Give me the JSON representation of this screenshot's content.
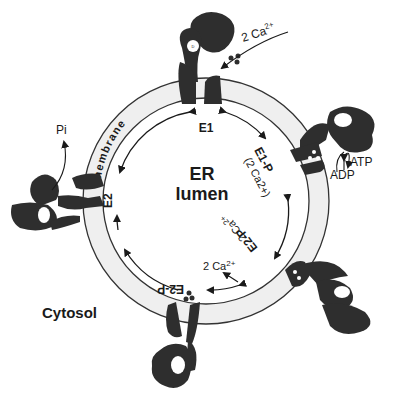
{
  "diagram": {
    "center_label": {
      "line1": "ER",
      "line2": "lumen"
    },
    "outside_label": "Cytosol",
    "membrane_label": "membrane",
    "states": {
      "e1": "E1",
      "e1p": "E1-P",
      "e1p_sub": "(2 Ca2+)",
      "e2p": "E2-P",
      "e2": "E2"
    },
    "species": {
      "ca_in": "2 Ca",
      "ca_in_sup": "2+",
      "ca_release_lumen": "2 Ca",
      "ca_release_lumen_sup": "2+",
      "ca_release_curve": "2 Ca2+",
      "atp": "ATP",
      "adp": "ADP",
      "pi": "Pi"
    },
    "colors": {
      "protein": "#2e2e2e",
      "membrane_fill": "#efefef",
      "membrane_stroke": "#333333",
      "text": "#1a1a1a"
    }
  }
}
